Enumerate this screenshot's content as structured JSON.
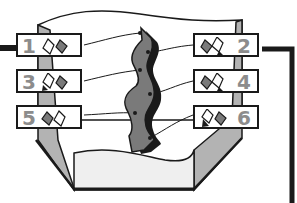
{
  "diagram": {
    "labels": [
      {
        "number": "1",
        "side": "left"
      },
      {
        "number": "2",
        "side": "right"
      },
      {
        "number": "3",
        "side": "left"
      },
      {
        "number": "4",
        "side": "right"
      },
      {
        "number": "5",
        "side": "left"
      },
      {
        "number": "6",
        "side": "right"
      }
    ],
    "colors": {
      "outline": "#1a1a1a",
      "arrow_fill": "#7a7a7a",
      "side_panel": "#b3b3b3",
      "bottom_fill": "#efefef",
      "number_text": "#8c8c8c"
    }
  }
}
